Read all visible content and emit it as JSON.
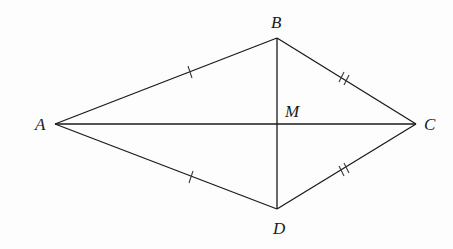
{
  "figure": {
    "type": "kite",
    "points": {
      "A": {
        "label": "A",
        "x": 55,
        "y": 124
      },
      "B": {
        "label": "B",
        "x": 277,
        "y": 38
      },
      "C": {
        "label": "C",
        "x": 416,
        "y": 124
      },
      "D": {
        "label": "D",
        "x": 277,
        "y": 209
      },
      "M": {
        "label": "M",
        "x": 277,
        "y": 124
      }
    },
    "labels": {
      "A": "A",
      "B": "B",
      "C": "C",
      "D": "D",
      "M": "M"
    },
    "segments": [
      {
        "from": "A",
        "to": "B",
        "ticks": 1
      },
      {
        "from": "B",
        "to": "C",
        "ticks": 2
      },
      {
        "from": "C",
        "to": "D",
        "ticks": 2
      },
      {
        "from": "D",
        "to": "A",
        "ticks": 1
      },
      {
        "from": "A",
        "to": "C",
        "ticks": 0
      },
      {
        "from": "B",
        "to": "D",
        "ticks": 0
      }
    ],
    "congruence": {
      "single_tick": [
        "AB",
        "AD"
      ],
      "double_tick": [
        "BC",
        "CD"
      ]
    },
    "colors": {
      "stroke": "#1a1a1a",
      "background": "#ffffff"
    }
  }
}
